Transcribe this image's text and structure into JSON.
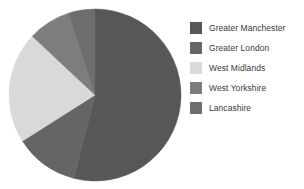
{
  "chart_data": {
    "type": "pie",
    "title": "",
    "legend_position": "right",
    "categories": [
      "Greater Manchester",
      "Greater London",
      "West Midlands",
      "West Yorkshire",
      "Lancashire"
    ],
    "values": [
      54,
      12,
      21,
      8,
      5
    ],
    "colors": [
      "#575757",
      "#656565",
      "#d9d9d9",
      "#7d7d7d",
      "#6e6e6e"
    ],
    "slices": [
      {
        "label": "Greater Manchester",
        "value": 54,
        "color": "#575757",
        "start_angle": 0,
        "end_angle": 194.4
      },
      {
        "label": "Greater London",
        "value": 12,
        "color": "#656565",
        "start_angle": 194.4,
        "end_angle": 237.6
      },
      {
        "label": "West Midlands",
        "value": 21,
        "color": "#d9d9d9",
        "start_angle": 237.6,
        "end_angle": 313.2
      },
      {
        "label": "West Yorkshire",
        "value": 8,
        "color": "#7d7d7d",
        "start_angle": 313.2,
        "end_angle": 342.0
      },
      {
        "label": "Lancashire",
        "value": 5,
        "color": "#6e6e6e",
        "start_angle": 342.0,
        "end_angle": 360.0
      }
    ]
  },
  "legend": {
    "items": [
      {
        "label": "Greater Manchester",
        "color": "#575757",
        "swatch_name": "legend-swatch-greater-manchester"
      },
      {
        "label": "Greater London",
        "color": "#656565",
        "swatch_name": "legend-swatch-greater-london"
      },
      {
        "label": "West Midlands",
        "color": "#d9d9d9",
        "swatch_name": "legend-swatch-west-midlands"
      },
      {
        "label": "West Yorkshire",
        "color": "#7d7d7d",
        "swatch_name": "legend-swatch-west-yorkshire"
      },
      {
        "label": "Lancashire",
        "color": "#6e6e6e",
        "swatch_name": "legend-swatch-lancashire"
      }
    ]
  },
  "pie": {
    "center_x": 88,
    "center_y": 88,
    "radius": 86,
    "background": "#ffffff"
  }
}
